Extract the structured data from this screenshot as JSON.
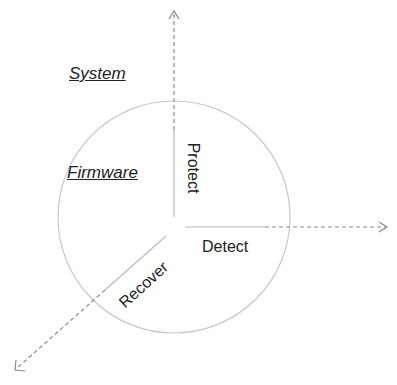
{
  "diagram": {
    "labels": {
      "system": "System",
      "firmware": "Firmware",
      "protect": "Protect",
      "detect": "Detect",
      "recover": "Recover"
    },
    "colors": {
      "circle": "#c8c8c8",
      "axis_solid": "#bbbbbb",
      "axis_dashed": "#8a8a8a",
      "text": "#222222"
    },
    "axes": [
      {
        "name": "protect-axis",
        "direction": "up"
      },
      {
        "name": "detect-axis",
        "direction": "right"
      },
      {
        "name": "recover-axis",
        "direction": "down-left"
      }
    ]
  }
}
